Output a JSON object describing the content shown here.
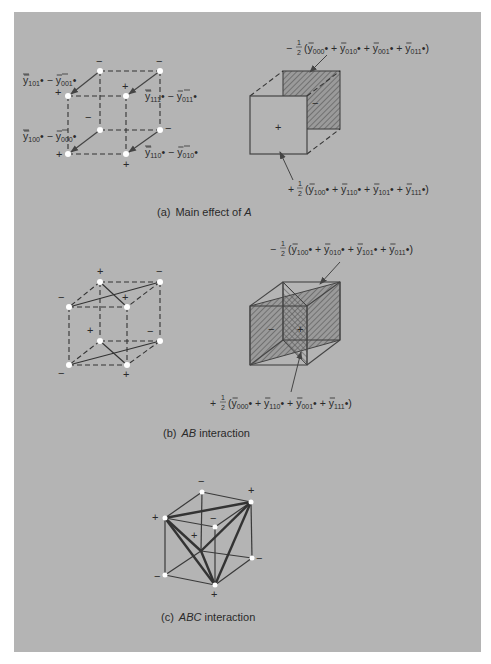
{
  "figure": {
    "panels": [
      {
        "id": "a",
        "caption_prefix": "(a)",
        "caption_text": "Main effect of ",
        "caption_italic": "A",
        "left_cube": {
          "vertex_signs": {
            "back_top_left": "−",
            "back_top_right": "−",
            "front_top_left": "+",
            "front_top_right": "+",
            "back_bottom_left": "−",
            "back_bottom_right": "−",
            "front_bottom_left": "+",
            "front_bottom_right": "+",
            "center": "−"
          },
          "differences": [
            {
              "a": "101",
              "b": "001"
            },
            {
              "a": "111",
              "b": "011"
            },
            {
              "a": "100",
              "b": "000"
            },
            {
              "a": "110",
              "b": "010"
            }
          ]
        },
        "right_cube": {
          "front_sign": "+",
          "back_sign": "−",
          "top_formula": {
            "sign": "−",
            "frac": "1/2",
            "terms": [
              "000",
              "010",
              "001",
              "011"
            ]
          },
          "bottom_formula": {
            "sign": "+",
            "frac": "1/2",
            "terms": [
              "100",
              "110",
              "101",
              "111"
            ]
          }
        }
      },
      {
        "id": "b",
        "caption_prefix": "(b)",
        "caption_italic": "AB",
        "caption_text": " interaction",
        "left_cube": {
          "vertex_signs": {
            "back_top_left": "+",
            "back_top_right": "−",
            "front_top_left": "−",
            "front_top_right": "+",
            "back_bottom_left": "+",
            "back_bottom_right": "−",
            "front_bottom_left": "−",
            "front_bottom_right": "+"
          }
        },
        "right_cube": {
          "left_sign": "−",
          "right_sign": "+",
          "top_formula": {
            "sign": "−",
            "frac": "1/2",
            "terms": [
              "100",
              "010",
              "101",
              "011"
            ]
          },
          "bottom_formula": {
            "sign": "+",
            "frac": "1/2",
            "terms": [
              "000",
              "110",
              "001",
              "111"
            ]
          }
        }
      },
      {
        "id": "c",
        "caption_prefix": "(c)",
        "caption_italic": "ABC",
        "caption_text": " interaction",
        "cube": {
          "vertex_signs": {
            "back_top_left": "−",
            "back_top_right": "+",
            "front_top_left": "+",
            "front_top_right": "−",
            "back_bottom_left": "+",
            "back_bottom_right": "−",
            "front_bottom_left": "−",
            "front_bottom_right": "+"
          }
        }
      }
    ],
    "symbols": {
      "ybar": "y",
      "dot": "•",
      "plus": "+",
      "minus": "−",
      "half_num": "1",
      "half_den": "2"
    }
  }
}
